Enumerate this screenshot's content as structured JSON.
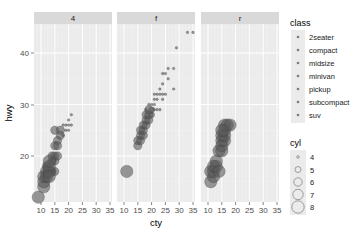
{
  "chart_data": {
    "type": "scatter",
    "title": "",
    "xlabel": "cty",
    "ylabel": "hwy",
    "xlim": [
      7.5,
      37.5
    ],
    "ylim": [
      11,
      45.6
    ],
    "x_ticks": [
      10,
      15,
      20,
      25,
      30,
      35
    ],
    "y_ticks": [
      20,
      30,
      40
    ],
    "grid": true,
    "facet_by": "drv",
    "facets": [
      "4",
      "f",
      "r"
    ],
    "color_legend": {
      "title": "class",
      "entries": [
        "2seater",
        "compact",
        "midsize",
        "minivan",
        "pickup",
        "subcompact",
        "suv"
      ],
      "position": "right"
    },
    "size_legend": {
      "title": "cyl",
      "entries": [
        "4",
        "5",
        "6",
        "7",
        "8"
      ],
      "position": "right"
    },
    "series": [
      {
        "facet": "4",
        "points": [
          {
            "cty": 9,
            "hwy": 12,
            "cyl": 8
          },
          {
            "cty": 11,
            "hwy": 14,
            "cyl": 8
          },
          {
            "cty": 11,
            "hwy": 15,
            "cyl": 8
          },
          {
            "cty": 11,
            "hwy": 16,
            "cyl": 8
          },
          {
            "cty": 12,
            "hwy": 16,
            "cyl": 8
          },
          {
            "cty": 12,
            "hwy": 17,
            "cyl": 8
          },
          {
            "cty": 13,
            "hwy": 17,
            "cyl": 8
          },
          {
            "cty": 13,
            "hwy": 18,
            "cyl": 8
          },
          {
            "cty": 12,
            "hwy": 18,
            "cyl": 6
          },
          {
            "cty": 13,
            "hwy": 19,
            "cyl": 8
          },
          {
            "cty": 14,
            "hwy": 19,
            "cyl": 6
          },
          {
            "cty": 14,
            "hwy": 20,
            "cyl": 6
          },
          {
            "cty": 15,
            "hwy": 20,
            "cyl": 6
          },
          {
            "cty": 15,
            "hwy": 19,
            "cyl": 6
          },
          {
            "cty": 14,
            "hwy": 17,
            "cyl": 6
          },
          {
            "cty": 13,
            "hwy": 16,
            "cyl": 8
          },
          {
            "cty": 15,
            "hwy": 17,
            "cyl": 6
          },
          {
            "cty": 16,
            "hwy": 20,
            "cyl": 6
          },
          {
            "cty": 15,
            "hwy": 22,
            "cyl": 6
          },
          {
            "cty": 16,
            "hwy": 23,
            "cyl": 6
          },
          {
            "cty": 15,
            "hwy": 25,
            "cyl": 6
          },
          {
            "cty": 17,
            "hwy": 25,
            "cyl": 6
          },
          {
            "cty": 17,
            "hwy": 24,
            "cyl": 6
          },
          {
            "cty": 16,
            "hwy": 22,
            "cyl": 6
          },
          {
            "cty": 18,
            "hwy": 24,
            "cyl": 4
          },
          {
            "cty": 19,
            "hwy": 25,
            "cyl": 4
          },
          {
            "cty": 20,
            "hwy": 25,
            "cyl": 4
          },
          {
            "cty": 19,
            "hwy": 26,
            "cyl": 4
          },
          {
            "cty": 18,
            "hwy": 26,
            "cyl": 4
          },
          {
            "cty": 20,
            "hwy": 26,
            "cyl": 4
          },
          {
            "cty": 21,
            "hwy": 26,
            "cyl": 4
          },
          {
            "cty": 20,
            "hwy": 27,
            "cyl": 4
          },
          {
            "cty": 21,
            "hwy": 28,
            "cyl": 4
          }
        ]
      },
      {
        "facet": "f",
        "points": [
          {
            "cty": 11,
            "hwy": 17,
            "cyl": 8
          },
          {
            "cty": 15,
            "hwy": 22,
            "cyl": 6
          },
          {
            "cty": 15,
            "hwy": 23,
            "cyl": 6
          },
          {
            "cty": 16,
            "hwy": 23,
            "cyl": 6
          },
          {
            "cty": 16,
            "hwy": 24,
            "cyl": 6
          },
          {
            "cty": 16,
            "hwy": 25,
            "cyl": 6
          },
          {
            "cty": 17,
            "hwy": 24,
            "cyl": 6
          },
          {
            "cty": 17,
            "hwy": 25,
            "cyl": 6
          },
          {
            "cty": 17,
            "hwy": 26,
            "cyl": 6
          },
          {
            "cty": 18,
            "hwy": 26,
            "cyl": 6
          },
          {
            "cty": 18,
            "hwy": 27,
            "cyl": 6
          },
          {
            "cty": 18,
            "hwy": 28,
            "cyl": 6
          },
          {
            "cty": 19,
            "hwy": 27,
            "cyl": 6
          },
          {
            "cty": 19,
            "hwy": 28,
            "cyl": 6
          },
          {
            "cty": 19,
            "hwy": 29,
            "cyl": 6
          },
          {
            "cty": 20,
            "hwy": 28,
            "cyl": 5
          },
          {
            "cty": 20,
            "hwy": 29,
            "cyl": 5
          },
          {
            "cty": 18,
            "hwy": 29,
            "cyl": 4
          },
          {
            "cty": 19,
            "hwy": 30,
            "cyl": 4
          },
          {
            "cty": 20,
            "hwy": 30,
            "cyl": 4
          },
          {
            "cty": 21,
            "hwy": 29,
            "cyl": 4
          },
          {
            "cty": 21,
            "hwy": 30,
            "cyl": 4
          },
          {
            "cty": 21,
            "hwy": 31,
            "cyl": 4
          },
          {
            "cty": 22,
            "hwy": 31,
            "cyl": 4
          },
          {
            "cty": 22,
            "hwy": 29,
            "cyl": 4
          },
          {
            "cty": 23,
            "hwy": 29,
            "cyl": 4
          },
          {
            "cty": 21,
            "hwy": 32,
            "cyl": 4
          },
          {
            "cty": 22,
            "hwy": 32,
            "cyl": 4
          },
          {
            "cty": 23,
            "hwy": 32,
            "cyl": 4
          },
          {
            "cty": 24,
            "hwy": 32,
            "cyl": 4
          },
          {
            "cty": 23,
            "hwy": 33,
            "cyl": 4
          },
          {
            "cty": 24,
            "hwy": 31,
            "cyl": 4
          },
          {
            "cty": 25,
            "hwy": 32,
            "cyl": 4
          },
          {
            "cty": 24,
            "hwy": 34,
            "cyl": 4
          },
          {
            "cty": 24,
            "hwy": 36,
            "cyl": 4
          },
          {
            "cty": 25,
            "hwy": 36,
            "cyl": 4
          },
          {
            "cty": 26,
            "hwy": 35,
            "cyl": 4
          },
          {
            "cty": 26,
            "hwy": 37,
            "cyl": 4
          },
          {
            "cty": 28,
            "hwy": 33,
            "cyl": 4
          },
          {
            "cty": 28,
            "hwy": 37,
            "cyl": 4
          },
          {
            "cty": 29,
            "hwy": 41,
            "cyl": 4
          },
          {
            "cty": 33,
            "hwy": 44,
            "cyl": 4
          },
          {
            "cty": 35,
            "hwy": 44,
            "cyl": 4
          }
        ]
      },
      {
        "facet": "r",
        "points": [
          {
            "cty": 11,
            "hwy": 15,
            "cyl": 8
          },
          {
            "cty": 11,
            "hwy": 17,
            "cyl": 8
          },
          {
            "cty": 12,
            "hwy": 16,
            "cyl": 8
          },
          {
            "cty": 12,
            "hwy": 17,
            "cyl": 8
          },
          {
            "cty": 12,
            "hwy": 18,
            "cyl": 8
          },
          {
            "cty": 13,
            "hwy": 18,
            "cyl": 8
          },
          {
            "cty": 13,
            "hwy": 19,
            "cyl": 8
          },
          {
            "cty": 14,
            "hwy": 17,
            "cyl": 8
          },
          {
            "cty": 14,
            "hwy": 21,
            "cyl": 8
          },
          {
            "cty": 15,
            "hwy": 21,
            "cyl": 8
          },
          {
            "cty": 15,
            "hwy": 22,
            "cyl": 8
          },
          {
            "cty": 15,
            "hwy": 23,
            "cyl": 8
          },
          {
            "cty": 16,
            "hwy": 23,
            "cyl": 8
          },
          {
            "cty": 15,
            "hwy": 24,
            "cyl": 8
          },
          {
            "cty": 16,
            "hwy": 24,
            "cyl": 8
          },
          {
            "cty": 16,
            "hwy": 25,
            "cyl": 8
          },
          {
            "cty": 16,
            "hwy": 26,
            "cyl": 8
          },
          {
            "cty": 17,
            "hwy": 26,
            "cyl": 8
          },
          {
            "cty": 18,
            "hwy": 26,
            "cyl": 8
          },
          {
            "cty": 15,
            "hwy": 25,
            "cyl": 8
          }
        ]
      }
    ]
  },
  "axes": {
    "xlabel": "cty",
    "ylabel": "hwy",
    "x_tick_labels": [
      "10",
      "15",
      "20",
      "25",
      "30",
      "35"
    ],
    "y_tick_labels": [
      "20",
      "30",
      "40"
    ]
  },
  "strips": [
    "4",
    "f",
    "r"
  ],
  "legend_class": {
    "title": "class",
    "items": [
      "2seater",
      "compact",
      "midsize",
      "minivan",
      "pickup",
      "subcompact",
      "suv"
    ]
  },
  "legend_cyl": {
    "title": "cyl",
    "items": [
      "4",
      "5",
      "6",
      "7",
      "8"
    ]
  },
  "colors": {
    "panel_bg": "#ebebeb",
    "strip_bg": "#d9d9d9",
    "grid_major": "#ffffff",
    "point_fill": "#595959",
    "point_stroke": "#333333"
  }
}
